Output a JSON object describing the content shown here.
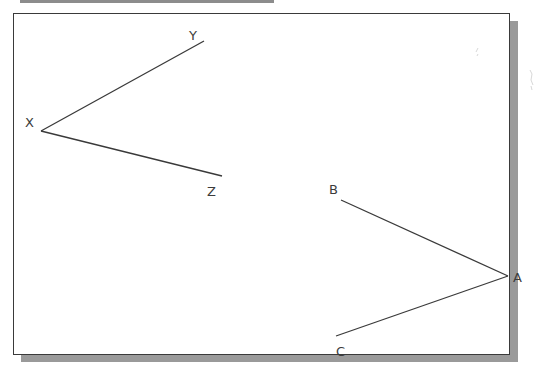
{
  "figure": {
    "angle_left": {
      "vertex": {
        "label": "X",
        "x": 41,
        "y": 131,
        "label_x": 25,
        "label_y": 127
      },
      "ray1_end": {
        "label": "Y",
        "x": 204,
        "y": 41,
        "label_x": 189,
        "label_y": 40
      },
      "ray2_end": {
        "label": "Z",
        "x": 222,
        "y": 176,
        "label_x": 207,
        "label_y": 196
      }
    },
    "angle_right": {
      "vertex": {
        "label": "A",
        "x": 508,
        "y": 276,
        "label_x": 513,
        "label_y": 282
      },
      "ray1_end": {
        "label": "B",
        "x": 341,
        "y": 200,
        "label_x": 329,
        "label_y": 194
      },
      "ray2_end": {
        "label": "C",
        "x": 336,
        "y": 336,
        "label_x": 336,
        "label_y": 356
      }
    },
    "colors": {
      "line": "#3a3a3a",
      "label": "#3c3c3c",
      "frame_border": "#3a3a3a",
      "shadow": "#9a9a9a",
      "background": "#ffffff"
    }
  }
}
